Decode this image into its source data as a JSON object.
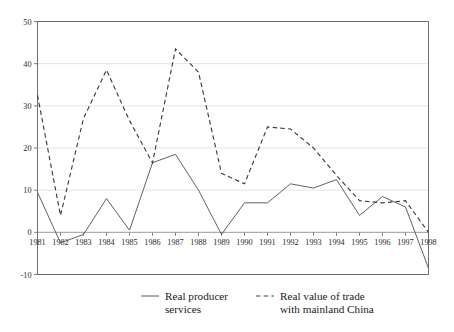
{
  "chart_data": {
    "type": "line",
    "title": "",
    "subtitle": "",
    "xlabel": "",
    "ylabel": "",
    "categories": [
      "1981",
      "1982",
      "1983",
      "1984",
      "1985",
      "1986",
      "1987",
      "1988",
      "1989",
      "1990",
      "1991",
      "1992",
      "1993",
      "1994",
      "1995",
      "1996",
      "1997",
      "1998"
    ],
    "x": [
      1981,
      1982,
      1983,
      1984,
      1985,
      1986,
      1987,
      1988,
      1989,
      1990,
      1991,
      1992,
      1993,
      1994,
      1995,
      1996,
      1997,
      1998
    ],
    "xlim": [
      1981,
      1998
    ],
    "ylim": [
      -10,
      50
    ],
    "yticks": [
      -10,
      0,
      10,
      20,
      30,
      40,
      50
    ],
    "ytick_labels": [
      "-10",
      "0",
      "10",
      "20",
      "30",
      "40",
      "50"
    ],
    "grid": true,
    "legend_position": "bottom",
    "series": [
      {
        "name": "Real producer services",
        "style": "solid",
        "color": "#595959",
        "values": [
          9.5,
          -2.5,
          -0.5,
          8.0,
          0.5,
          16.5,
          18.5,
          10.0,
          -0.5,
          7.0,
          7.0,
          11.5,
          10.5,
          12.5,
          4.0,
          8.5,
          6.0,
          -8.5
        ]
      },
      {
        "name": "Real value of trade with mainland China",
        "style": "dashed",
        "color": "#3d3d3d",
        "values": [
          32.5,
          4.0,
          27.0,
          38.5,
          26.5,
          16.5,
          43.5,
          38.0,
          14.0,
          11.5,
          25.0,
          24.5,
          20.0,
          13.5,
          7.5,
          7.0,
          7.5,
          0.0
        ]
      }
    ]
  },
  "legend": {
    "items": [
      {
        "label_line1": "Real producer",
        "label_line2": "services",
        "style": "solid"
      },
      {
        "label_line1": "Real value of trade",
        "label_line2": "with mainland China",
        "style": "dashed"
      }
    ]
  },
  "axes": {
    "y_tick_labels": [
      "50",
      "40",
      "30",
      "20",
      "10",
      "0",
      "-10"
    ],
    "x_tick_labels": [
      "1981",
      "1982",
      "1983",
      "1984",
      "1985",
      "1986",
      "1987",
      "1988",
      "1989",
      "1990",
      "1991",
      "1992",
      "1993",
      "1994",
      "1995",
      "1996",
      "1997",
      "1998"
    ]
  }
}
